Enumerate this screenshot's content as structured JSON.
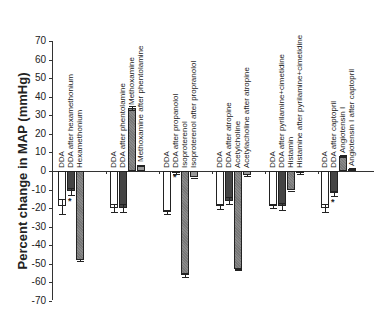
{
  "chart_data": {
    "type": "bar",
    "title": "",
    "xlabel": "",
    "ylabel": "Percent change in MAP (mmHg)",
    "ylim": [
      -70,
      70
    ],
    "yticks": [
      70,
      60,
      50,
      40,
      30,
      20,
      10,
      0,
      -10,
      -20,
      -30,
      -40,
      -50,
      -60,
      -70
    ],
    "grid": false,
    "legend": null,
    "groups": [
      {
        "bars": [
          {
            "label": "DDA",
            "value": -19,
            "error": 4,
            "fill": "white"
          },
          {
            "label": "DDA after hexamethonium",
            "value": -11,
            "error": 2,
            "fill": "dark",
            "significant": true
          },
          {
            "label": "Hexamethonium",
            "value": -48,
            "error": 0.5,
            "fill": "gray"
          }
        ]
      },
      {
        "bars": [
          {
            "label": "DDA",
            "value": -20,
            "error": 2,
            "fill": "white"
          },
          {
            "label": "DDA after phentolamine",
            "value": -20,
            "error": 2,
            "fill": "dark"
          },
          {
            "label": "Methoxamine",
            "value": 34,
            "error": 1,
            "fill": "gray"
          },
          {
            "label": "Methoxamine after  phentolamine",
            "value": 3,
            "error": 0.5,
            "fill": "mid"
          }
        ]
      },
      {
        "bars": [
          {
            "label": "DDA",
            "value": -22,
            "error": 1,
            "fill": "white"
          },
          {
            "label": "DDA after propanolol",
            "value": -1,
            "error": 0.5,
            "fill": "white",
            "significant": true
          },
          {
            "label": "Isoproterenol",
            "value": -56,
            "error": 1,
            "fill": "gray"
          },
          {
            "label": "Isoproterenol after propranolol",
            "value": -3,
            "error": 0.5,
            "fill": "mid"
          }
        ]
      },
      {
        "bars": [
          {
            "label": "DDA",
            "value": -19,
            "error": 1.5,
            "fill": "white"
          },
          {
            "label": "DDA after atropine",
            "value": -16,
            "error": 2,
            "fill": "dark"
          },
          {
            "label": "Acetylcholine",
            "value": -53,
            "error": 0.5,
            "fill": "gray"
          },
          {
            "label": "Acetylacholine after atropine",
            "value": -2,
            "error": 0.5,
            "fill": "mid"
          }
        ]
      },
      {
        "bars": [
          {
            "label": "DDA",
            "value": -19,
            "error": 1,
            "fill": "white"
          },
          {
            "label": "DDA after pyrilamine+cimetidine",
            "value": -19,
            "error": 2,
            "fill": "dark"
          },
          {
            "label": "Histamin",
            "value": -10,
            "error": 0.5,
            "fill": "gray"
          },
          {
            "label": "Histamine after pyrilamine+cimetidine",
            "value": -1,
            "error": 0.5,
            "fill": "mid"
          }
        ]
      },
      {
        "bars": [
          {
            "label": "DDA",
            "value": -20,
            "error": 2,
            "fill": "white"
          },
          {
            "label": "DDA after captopril",
            "value": -12,
            "error": 1.5,
            "fill": "dark",
            "significant": true
          },
          {
            "label": "Angiotensin I",
            "value": 8,
            "error": 0.5,
            "fill": "gray"
          },
          {
            "label": "Angiotensin I after captopril",
            "value": 1,
            "error": 0.5,
            "fill": "mid"
          }
        ]
      }
    ],
    "annotations": [
      "* significant difference marker"
    ]
  },
  "significance_marker": "*"
}
